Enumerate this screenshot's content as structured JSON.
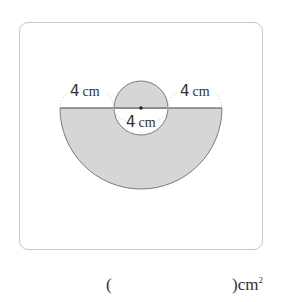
{
  "figure": {
    "labels": {
      "left_arc": {
        "value": "4",
        "unit": "cm"
      },
      "right_arc": {
        "value": "4",
        "unit": "cm"
      },
      "small_diameter": {
        "value": "4",
        "unit": "cm"
      }
    },
    "colors": {
      "shade": "#d6d6d6",
      "stroke": "#7a7a7a",
      "dotted": "#cfcfcf",
      "border": "#c8c8c8"
    }
  },
  "answer": {
    "open_paren": "(",
    "close_paren": ")",
    "unit": "cm",
    "unit_exp": "2"
  }
}
